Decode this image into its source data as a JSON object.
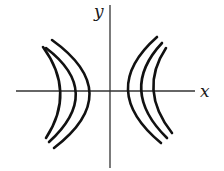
{
  "diagram": {
    "type": "level-curves",
    "axes": {
      "x_label": "x",
      "y_label": "y"
    },
    "curves": [
      {
        "side": "left",
        "d": "M43,47 Q76,92 46,138"
      },
      {
        "side": "left",
        "d": "M46,48 Q104,92 49,142"
      },
      {
        "side": "left",
        "d": "M52,40 Q126,93 54,148"
      },
      {
        "side": "right",
        "d": "M157,37 Q97,90 161,143"
      },
      {
        "side": "right",
        "d": "M162,43 Q118,90 167,138"
      },
      {
        "side": "right",
        "d": "M166,48 Q138,90 172,133"
      }
    ],
    "colors": {
      "curve": "#111111",
      "axis": "#333333"
    }
  }
}
